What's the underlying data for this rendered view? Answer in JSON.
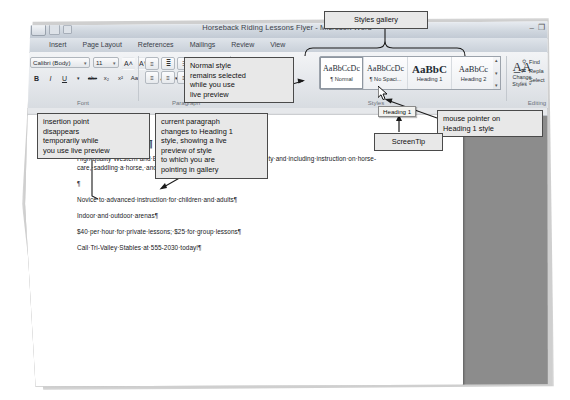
{
  "window": {
    "title": "Horseback Riding Lessons Flyer - Microsoft Word",
    "minimize": "–",
    "restore": "❐",
    "quick_access": [
      "office-orb",
      "save-icon",
      "undo-icon"
    ]
  },
  "ribbon": {
    "tabs": [
      {
        "label": "Insert",
        "active": false
      },
      {
        "label": "Page Layout",
        "active": false
      },
      {
        "label": "References",
        "active": false
      },
      {
        "label": "Mailings",
        "active": false
      },
      {
        "label": "Review",
        "active": false
      },
      {
        "label": "View",
        "active": false
      }
    ],
    "font_group": {
      "label": "Font",
      "font_name": "Calibri (Body)",
      "font_size": "11",
      "caret": "▾",
      "grow_font": "A˄",
      "shrink_font": "A˅",
      "clear_formatting": "⌫",
      "bold": "B",
      "italic": "I",
      "underline": "U",
      "strikethrough": "abe",
      "subscript": "x₂",
      "superscript": "x²",
      "change_case": "Aa",
      "highlight": "✐",
      "font_color": "A"
    },
    "paragraph_group": {
      "label": "Paragraph",
      "bullets": "≡",
      "numbering": "≣",
      "multilevel": "☰",
      "decrease_indent": "←",
      "increase_indent": "→",
      "sort": "↓",
      "show_marks": "¶",
      "align_left": "≡",
      "align_center": "≡",
      "align_right": "≡",
      "justify": "≡",
      "line_spacing": "↕",
      "shading": "■",
      "borders": "▦"
    },
    "styles_group": {
      "label": "Styles",
      "gallery": [
        {
          "sample": "AaBbCcDc",
          "name": "¶ Normal",
          "selected": true,
          "size": "normal"
        },
        {
          "sample": "AaBbCcDc",
          "name": "¶ No Spaci...",
          "selected": false,
          "size": "normal"
        },
        {
          "sample": "AaBbC",
          "name": "Heading 1",
          "selected": false,
          "size": "big",
          "hovered": true
        },
        {
          "sample": "AaBbCc",
          "name": "Heading 2",
          "selected": false,
          "size": "h2"
        }
      ],
      "scroll_up": "▴",
      "scroll_down": "▾",
      "scroll_more": "▾",
      "change_styles": {
        "glyph": "A̲A",
        "line1": "Change",
        "line2": "Styles ˅"
      }
    },
    "editing_group": {
      "label": "Editing",
      "items": [
        {
          "icon": "binoculars-icon",
          "glyph": "⚲",
          "label": "Find"
        },
        {
          "icon": "replace-icon",
          "glyph": "⇄",
          "label": "Repla"
        },
        {
          "icon": "select-icon",
          "glyph": "⬚",
          "label": "Select"
        }
      ]
    }
  },
  "document": {
    "heading": "Learn·to·Ride¶",
    "paragraphs": [
      "High-quality·Western·and·English·riding·lessons,·focusing·on·safety·and·including·instruction·on·horse-care,·saddling·a·horse,·and·other·aspects·of·horsemanship.¶",
      "¶",
      "Novice·to·advanced·instruction·for·children·and·adults¶",
      "Indoor·and·outdoor·arenas¶",
      "$40·per·hour·for·private·lessons;·$25·for·group·lessons¶",
      "Call·Tri-Valley·Stables·at·555-2030·today!¶"
    ],
    "insertion_mark": "·¶"
  },
  "annotations": {
    "styles_gallery": "Styles gallery",
    "normal_style": "Normal style\nremains selected\nwhile you use\nlive preview",
    "insertion_point": "insertion point\ndisappears\ntemporarily while\nyou use live preview",
    "current_paragraph": "current paragraph\nchanges to Heading 1\nstyle, showing a live\npreview of style\nto which you are\npointing in gallery",
    "mouse_pointer": "mouse pointer on\nHeading 1 style",
    "screentip_label": "ScreenTip",
    "screentip_text": "Heading 1"
  },
  "colors": {
    "callout_bg": "#e8e8e8",
    "callout_border": "#4a4a4a",
    "ribbon_bg": "#e4e7eb",
    "doc_bg": "#8c8c8c",
    "screentip_bg": "#f3f3f0"
  }
}
